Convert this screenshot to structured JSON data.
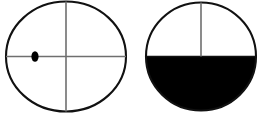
{
  "figure": {
    "canvas": {
      "width": 268,
      "height": 119,
      "background": "#ffffff"
    },
    "colors": {
      "outline": "#111111",
      "crosshair": "#6f6f6f",
      "fill_black": "#000000",
      "fill_white": "#ffffff",
      "marker": "#000000"
    },
    "shapes": [
      {
        "id": "left-circle",
        "label": "circle with crosshair and marker dot",
        "cx": 66,
        "cy": 56.5,
        "rx": 60,
        "ry": 55,
        "fill": "#ffffff",
        "stroke": "#111111",
        "stroke_width": 2.1,
        "vertical_line": {
          "x": 66,
          "y1": 1.5,
          "y2": 111.5,
          "stroke": "#6f6f6f",
          "stroke_width": 1.6
        },
        "horizontal_line": {
          "y": 56.5,
          "x1": 6,
          "x2": 126,
          "stroke": "#6f6f6f",
          "stroke_width": 1.6
        },
        "marker": {
          "cx": 35,
          "cy": 56.5,
          "rx": 3.6,
          "ry": 5.2,
          "fill": "#000000"
        }
      },
      {
        "id": "right-circle",
        "label": "circle with lower half filled black",
        "cx": 201,
        "cy": 56.5,
        "rx": 55,
        "ry": 54,
        "fill_top": "#ffffff",
        "fill_bottom": "#000000",
        "stroke": "#111111",
        "stroke_width": 2.1,
        "vertical_line": {
          "x": 201,
          "y1": 2.5,
          "y2": 56.5,
          "stroke": "#6f6f6f",
          "stroke_width": 1.6
        },
        "horizontal_line": {
          "y": 56.5,
          "x1": 146,
          "x2": 256,
          "stroke": "#111111",
          "stroke_width": 1.6
        }
      }
    ]
  }
}
